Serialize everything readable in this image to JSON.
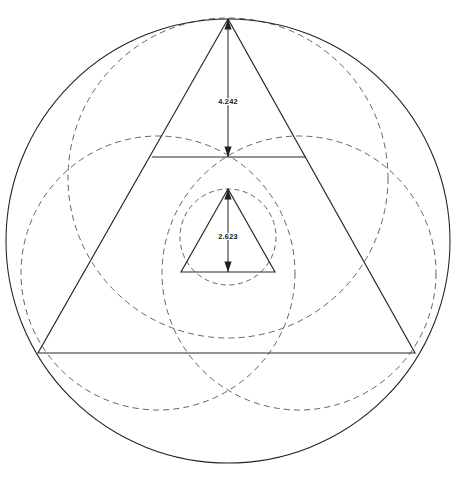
{
  "figure": {
    "background_color": "#ffffff",
    "solid_color": "#231f20",
    "dashed_color": "#5d5a5e",
    "label_color": "#1a1718"
  },
  "dimensions": {
    "outer_height": {
      "value": "4.242",
      "from_y": 19,
      "to_y": 157,
      "x": 228,
      "label_x": 228,
      "label_y": 101
    },
    "inner_height": {
      "value": "2.623",
      "from_y": 189,
      "to_y": 272,
      "x": 228,
      "label_x": 228,
      "label_y": 236
    }
  },
  "shapes": {
    "outer_circle": {
      "cx": 228,
      "cy": 241,
      "r": 222,
      "style": "solid"
    },
    "outer_triangle": {
      "apex": {
        "x": 228,
        "y": 19
      },
      "left": {
        "x": 38,
        "y": 353
      },
      "right": {
        "x": 415,
        "y": 353
      },
      "style": "solid"
    },
    "midline": {
      "x1": 152,
      "y1": 157,
      "x2": 306,
      "y2": 157,
      "style": "solid"
    },
    "inner_triangle": {
      "apex": {
        "x": 228,
        "y": 189
      },
      "left": {
        "x": 181,
        "y": 272
      },
      "right": {
        "x": 275,
        "y": 272
      },
      "style": "solid"
    },
    "dashed_circle_top": {
      "cx": 228,
      "cy": 178,
      "r": 160,
      "style": "dashed"
    },
    "dashed_circle_left": {
      "cx": 158,
      "cy": 273,
      "r": 137,
      "style": "dashed"
    },
    "dashed_circle_right": {
      "cx": 299,
      "cy": 273,
      "r": 137,
      "style": "dashed"
    },
    "dashed_circle_inner": {
      "cx": 228,
      "cy": 237,
      "r": 48,
      "style": "dashed"
    }
  },
  "icons": {
    "arrow_up": "arrow-up-icon",
    "arrow_down": "arrow-down-icon"
  }
}
